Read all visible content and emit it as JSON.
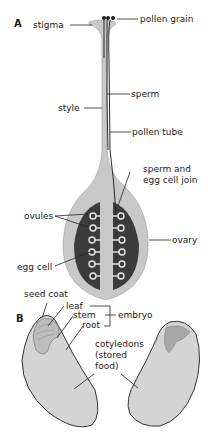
{
  "panel_a": {
    "letter": "A",
    "labels": {
      "stigma": "stigma",
      "pollen_grain": "pollen grain",
      "sperm": "sperm",
      "style": "style",
      "pollen_tube": "pollen tube",
      "sperm_egg_join_1": "sperm and",
      "sperm_egg_join_2": "egg cell join",
      "ovules": "ovules",
      "ovary": "ovary",
      "egg_cell": "egg cell"
    }
  },
  "panel_b": {
    "letter": "B",
    "labels": {
      "seed_coat": "seed coat",
      "leaf": "leaf",
      "stem": "stem",
      "root": "root",
      "embryo": "embryo",
      "cotyledons_1": "cotyledons",
      "cotyledons_2": "(stored",
      "cotyledons_3": "food)"
    }
  },
  "colors": {
    "tissue_light": "#c9c9c9",
    "tissue_mid": "#b5b5b5",
    "ovary_inner": "#3a3a3a",
    "seed_fill": "#d4d4d4",
    "outline": "#333333"
  }
}
